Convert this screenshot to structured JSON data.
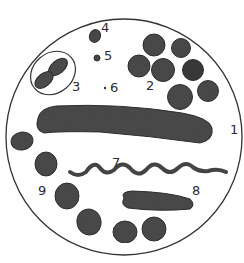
{
  "diagram": {
    "colors": {
      "cell": "#4a4a4a",
      "outline": "#333333",
      "background": "#ffffff"
    },
    "labels": [
      {
        "id": "1",
        "text": "1",
        "x": 230,
        "y": 134
      },
      {
        "id": "2",
        "text": "2",
        "x": 146,
        "y": 90
      },
      {
        "id": "3",
        "text": "3",
        "x": 72,
        "y": 91
      },
      {
        "id": "4",
        "text": "4",
        "x": 101,
        "y": 32
      },
      {
        "id": "5",
        "text": "5",
        "x": 104,
        "y": 60
      },
      {
        "id": "6",
        "text": "6",
        "x": 110,
        "y": 92
      },
      {
        "id": "7",
        "text": "7",
        "x": 112,
        "y": 167
      },
      {
        "id": "8",
        "text": "8",
        "x": 192,
        "y": 195
      },
      {
        "id": "9",
        "text": "9",
        "x": 38,
        "y": 195
      }
    ],
    "nodes": [
      {
        "id": "1",
        "shape": "long curved rod (bacillus)"
      },
      {
        "id": "2",
        "shape": "cluster of cocci (staphylococci)"
      },
      {
        "id": "3",
        "shape": "diplococcus in capsule"
      },
      {
        "id": "4",
        "shape": "single coccus"
      },
      {
        "id": "5",
        "shape": "small coccus"
      },
      {
        "id": "6",
        "shape": "minute dot"
      },
      {
        "id": "7",
        "shape": "spiral (spirillum)"
      },
      {
        "id": "8",
        "shape": "short rod"
      },
      {
        "id": "9",
        "shape": "chain of cocci (streptococci)"
      }
    ]
  }
}
